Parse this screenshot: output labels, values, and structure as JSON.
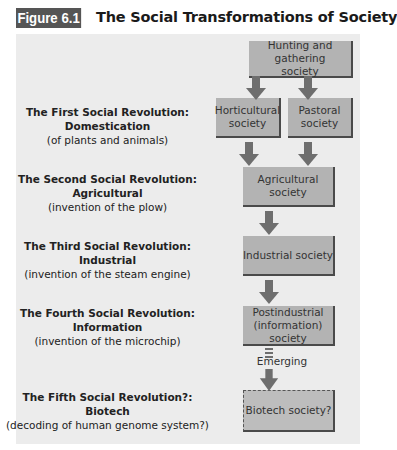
{
  "figure": {
    "label": "Figure 6.1",
    "title": "The Social Transformations of Society"
  },
  "colors": {
    "label_bg": "#555555",
    "panel_bg": "#ececec",
    "box_bg": "#b3b3b3",
    "box_border": "#4a4a4a",
    "arrow": "#6e6e6e"
  },
  "societies": {
    "hunting": "Hunting and gathering society",
    "horticultural": "Horticultural society",
    "pastoral": "Pastoral society",
    "agricultural": "Agricultural society",
    "industrial": "Industrial society",
    "postindustrial": "Postindustrial (information) society",
    "biotech": "Biotech society?"
  },
  "connector_label": "Emerging",
  "revolutions": [
    {
      "title": "The First Social Revolution:",
      "name": "Domestication",
      "subtitle": "(of plants and animals)"
    },
    {
      "title": "The Second Social Revolution:",
      "name": "Agricultural",
      "subtitle": "(invention of the plow)"
    },
    {
      "title": "The Third Social Revolution:",
      "name": "Industrial",
      "subtitle": "(invention of the steam engine)"
    },
    {
      "title": "The Fourth Social Revolution:",
      "name": "Information",
      "subtitle": "(invention of the microchip)"
    },
    {
      "title": "The Fifth Social Revolution?:",
      "name": "Biotech",
      "subtitle": "(decoding of human genome system?)"
    }
  ]
}
